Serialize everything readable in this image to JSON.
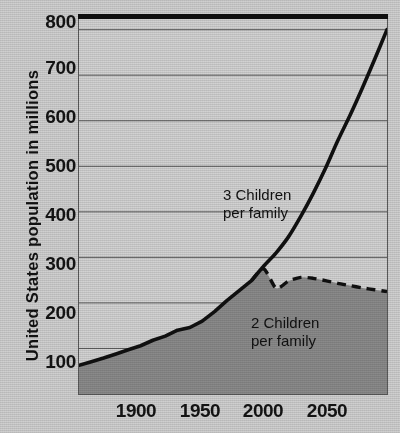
{
  "chart_data": {
    "type": "line",
    "title": "",
    "subtitle": "",
    "xlabel": "",
    "ylabel": "United States population in millions",
    "xlim": [
      1850,
      2100
    ],
    "ylim": [
      0,
      830
    ],
    "grid": true,
    "legend_position": "inline-annotations",
    "x_ticks": [
      "1900",
      "1950",
      "2000",
      "2050"
    ],
    "x_tick_values": [
      1900,
      1950,
      2000,
      2050
    ],
    "y_ticks": [
      "100",
      "200",
      "300",
      "400",
      "500",
      "600",
      "700",
      "800"
    ],
    "y_tick_values": [
      100,
      200,
      300,
      400,
      500,
      600,
      700,
      800
    ],
    "series": [
      {
        "name": "3 Children per family",
        "style": "solid",
        "color": "#101010",
        "x": [
          1850,
          1860,
          1870,
          1880,
          1890,
          1900,
          1910,
          1920,
          1930,
          1940,
          1950,
          1960,
          1970,
          1980,
          1990,
          2000,
          2010,
          2020,
          2030,
          2040,
          2050,
          2060,
          2070,
          2080,
          2090,
          2100
        ],
        "values": [
          63,
          71,
          79,
          88,
          97,
          106,
          118,
          127,
          140,
          146,
          160,
          181,
          205,
          227,
          249,
          281,
          310,
          345,
          390,
          440,
          495,
          556,
          612,
          672,
          735,
          800
        ]
      },
      {
        "name": "2 Children per family",
        "style": "dashed",
        "color": "#101010",
        "x": [
          1990,
          2000,
          2010,
          2020,
          2030,
          2040,
          2050,
          2060,
          2070,
          2080,
          2090,
          2100
        ],
        "values": [
          249,
          275,
          232,
          248,
          256,
          254,
          249,
          243,
          238,
          233,
          229,
          225
        ]
      }
    ],
    "annotations": [
      {
        "id": "annot-3",
        "text": "3 Children\nper family",
        "x": 1985,
        "y": 470
      },
      {
        "id": "annot-2",
        "text": "2 Children\nper family",
        "x": 2020,
        "y": 175
      }
    ],
    "area_fill": {
      "color": "#8a8a8a",
      "description": "shaded region beneath the population curves"
    },
    "plot_background": "#d2d2d2",
    "page_background": "#cfcfcf",
    "gridline_color": "#5a5a5a",
    "top_rule_color": "#101010"
  }
}
